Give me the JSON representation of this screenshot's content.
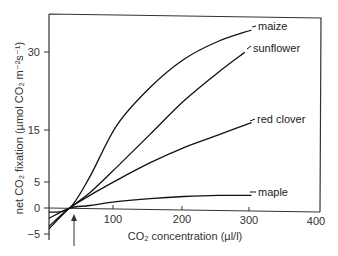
{
  "chart_data": {
    "type": "line",
    "title": "",
    "xlabel": "CO₂ concentration (µl/l)",
    "ylabel": "net CO₂ fixation (µmol CO₂ m⁻²s⁻¹)",
    "xlim": [
      0,
      400
    ],
    "ylim": [
      -5,
      37
    ],
    "x_ticks": [
      100,
      200,
      300,
      400
    ],
    "y_ticks": [
      -5,
      0,
      5,
      15,
      30
    ],
    "grid": false,
    "legend_position": "inline labels at curve ends",
    "series": [
      {
        "name": "maize",
        "x": [
          0,
          30,
          60,
          100,
          150,
          200,
          250,
          300
        ],
        "y": [
          -0.8,
          0,
          6,
          16,
          23.5,
          29,
          32.5,
          34.8
        ]
      },
      {
        "name": "sunflower",
        "x": [
          0,
          30,
          60,
          100,
          150,
          200,
          250,
          290
        ],
        "y": [
          -4,
          0,
          3,
          8,
          14.5,
          21,
          26.5,
          30.5
        ]
      },
      {
        "name": "red clover",
        "x": [
          0,
          30,
          60,
          100,
          150,
          200,
          250,
          300
        ],
        "y": [
          -3.5,
          0,
          2.5,
          5.5,
          9,
          12,
          14.5,
          17
        ]
      },
      {
        "name": "maple",
        "x": [
          0,
          30,
          60,
          100,
          150,
          200,
          250,
          300
        ],
        "y": [
          -2,
          0,
          0.6,
          1.4,
          2.1,
          2.6,
          2.9,
          3
        ]
      }
    ],
    "annotations": [
      {
        "type": "arrow",
        "x": 37,
        "text": "",
        "meaning": "CO₂ compensation point"
      }
    ]
  },
  "axes": {
    "y_tick_labels": [
      "30",
      "15",
      "5",
      "0",
      "−5"
    ],
    "x_tick_labels": [
      "100",
      "200",
      "300",
      "400"
    ],
    "xlabel": "CO₂ concentration (µl/l)",
    "ylabel": "net CO₂ fixation (µmol CO₂ m⁻²s⁻¹)"
  },
  "labels": {
    "maize": "maize",
    "sunflower": "sunflower",
    "red_clover": "red clover",
    "maple": "maple"
  }
}
